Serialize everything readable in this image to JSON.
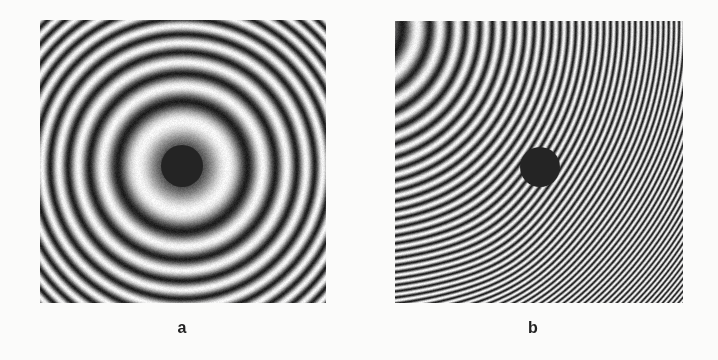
{
  "figure": {
    "panels": [
      {
        "id": "a",
        "label": "a",
        "type": "concentric-interference-rings",
        "box": {
          "x": 40,
          "y": 20,
          "w": 286,
          "h": 283
        },
        "pattern": {
          "cx": 182,
          "cy": 166,
          "alpha": 0.00142,
          "phase0": -2.86,
          "tilt": [
            0,
            0
          ]
        },
        "spot": {
          "cx": 182,
          "cy": 166,
          "r": 21,
          "color": "#242424"
        },
        "label_pos": {
          "x": 182,
          "y": 328
        }
      },
      {
        "id": "b",
        "label": "b",
        "type": "tilted-fringe-pattern",
        "box": {
          "x": 395,
          "y": 21,
          "w": 288,
          "h": 282
        },
        "pattern": {
          "cx": 384,
          "cy": 52,
          "alpha": 0.0019,
          "phase0": 0.0,
          "tilt": [
            0.05,
            0.05
          ]
        },
        "spot": {
          "cx": 540,
          "cy": 167,
          "r": 20,
          "color": "#242424"
        },
        "label_pos": {
          "x": 533,
          "y": 328
        }
      }
    ],
    "colors": {
      "background": "#fbfbfa",
      "dark": "#1e1e1e",
      "light": "#f4f4f4",
      "label": "#222222"
    }
  }
}
